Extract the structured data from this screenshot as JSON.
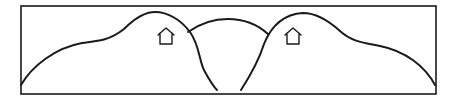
{
  "diagram": {
    "type": "line-drawing",
    "colors": {
      "background": "#ffffff",
      "ink": "#1a1a1a"
    },
    "frame": {
      "x": 21,
      "y": 6,
      "width": 415,
      "height": 88
    },
    "elements": [
      {
        "id": "left-hill",
        "kind": "hill-curve",
        "peak": [
          153,
          12
        ]
      },
      {
        "id": "right-hill",
        "kind": "hill-curve",
        "peak": [
          304,
          13
        ]
      },
      {
        "id": "middle-arc",
        "kind": "arc",
        "peak": [
          228,
          19
        ]
      },
      {
        "id": "left-house",
        "kind": "house-icon",
        "position": [
          166,
          36
        ]
      },
      {
        "id": "right-house",
        "kind": "house-icon",
        "position": [
          293,
          36
        ]
      }
    ]
  }
}
